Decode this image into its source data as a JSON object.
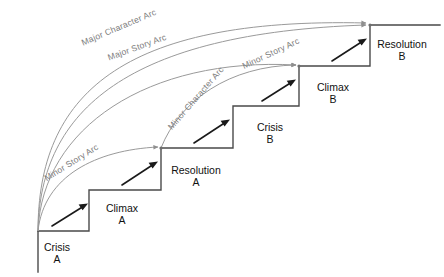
{
  "diagram": {
    "type": "staircase-arc-diagram",
    "colors": {
      "step_stroke": "#4a4a4a",
      "arc_stroke": "#9a9a9a",
      "arrow_fill": "#1a1a1a",
      "label_text": "#111111",
      "arc_label_text": "#7d7d7d",
      "background": "#ffffff"
    },
    "steps": [
      {
        "id": "crisis-a",
        "name": "Crisis",
        "sub": "A",
        "label_x": 57,
        "label_y": 251
      },
      {
        "id": "climax-a",
        "name": "Climax",
        "sub": "A",
        "label_x": 122,
        "label_y": 212
      },
      {
        "id": "resolution-a",
        "name": "Resolution",
        "sub": "A",
        "label_x": 196,
        "label_y": 174
      },
      {
        "id": "crisis-b",
        "name": "Crisis",
        "sub": "B",
        "label_x": 270,
        "label_y": 131
      },
      {
        "id": "climax-b",
        "name": "Climax",
        "sub": "B",
        "label_x": 333,
        "label_y": 91
      },
      {
        "id": "resolution-b",
        "name": "Resolution",
        "sub": "B",
        "label_x": 402,
        "label_y": 48
      }
    ],
    "arcs": [
      {
        "id": "major-character-arc",
        "label": "Major Character Arc"
      },
      {
        "id": "major-story-arc",
        "label": "Major Story Arc"
      },
      {
        "id": "minor-character-arc",
        "label": "Minor Character Arc"
      },
      {
        "id": "minor-story-arc-1",
        "label": "Minor Story Arc"
      },
      {
        "id": "minor-story-arc-2",
        "label": "Minor Story Arc"
      }
    ],
    "arc_labels": [
      {
        "id": "label-major-character-arc",
        "text": "Major Character Arc",
        "x": 120,
        "y": 30,
        "rotate": -23
      },
      {
        "id": "label-major-story-arc",
        "text": "Major Story Arc",
        "x": 138,
        "y": 50,
        "rotate": -20
      },
      {
        "id": "label-minor-character-arc",
        "text": "Minor Character Arc",
        "x": 198,
        "y": 100,
        "rotate": -49
      },
      {
        "id": "label-minor-story-arc-1",
        "text": "Minor Story Arc",
        "x": 73,
        "y": 165,
        "rotate": -32
      },
      {
        "id": "label-minor-story-arc-2",
        "text": "Minor Story Arc",
        "x": 272,
        "y": 56,
        "rotate": -25
      }
    ]
  }
}
